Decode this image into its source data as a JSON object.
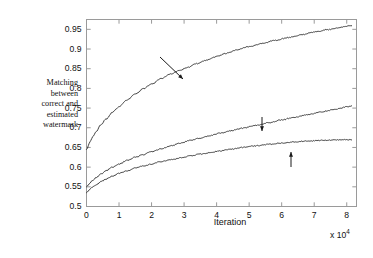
{
  "chart_data": {
    "type": "line",
    "title": "",
    "xlabel": "Iteration",
    "ylabel": "Matching between correct and estimated watermark",
    "x_multiplier": "x 10",
    "x_multiplier_exponent": "4",
    "xlim": [
      0,
      8.3
    ],
    "ylim": [
      0.5,
      0.975
    ],
    "xticks": [
      0,
      1,
      2,
      3,
      4,
      5,
      6,
      7,
      8
    ],
    "xtick_labels": [
      "0",
      "1",
      "2",
      "3",
      "4",
      "5",
      "6",
      "7",
      "8"
    ],
    "yticks": [
      0.5,
      0.55,
      0.6,
      0.65,
      0.7,
      0.75,
      0.8,
      0.85,
      0.9,
      0.95
    ],
    "ytick_labels": [
      "0.5",
      "0.55",
      "0.6",
      "0.65",
      "0.7",
      "0.75",
      "0.8",
      "0.85",
      "0.9",
      "0.95"
    ],
    "grid": false,
    "legend": "none",
    "line_color": "#2b2b2b",
    "frame_color": "#9a9a9a",
    "background": "#ffffff",
    "series": [
      {
        "name": "10 watermarked signals",
        "x": [
          0,
          0.1,
          0.2,
          0.3,
          0.45,
          0.6,
          0.8,
          1.0,
          1.25,
          1.5,
          1.75,
          2.0,
          2.3,
          2.6,
          2.9,
          3.1,
          3.4,
          3.7,
          4.0,
          4.3,
          4.6,
          5.0,
          5.4,
          5.8,
          6.2,
          6.6,
          7.0,
          7.4,
          7.8,
          8.15
        ],
        "values": [
          0.645,
          0.663,
          0.678,
          0.691,
          0.708,
          0.722,
          0.739,
          0.754,
          0.771,
          0.786,
          0.799,
          0.811,
          0.825,
          0.837,
          0.847,
          0.853,
          0.863,
          0.872,
          0.881,
          0.889,
          0.897,
          0.906,
          0.914,
          0.922,
          0.929,
          0.936,
          0.943,
          0.949,
          0.955,
          0.96
        ]
      },
      {
        "name": "2 watermarked signals",
        "x": [
          0,
          0.1,
          0.2,
          0.3,
          0.45,
          0.6,
          0.8,
          1.0,
          1.25,
          1.5,
          1.75,
          2.0,
          2.3,
          2.6,
          2.9,
          3.2,
          3.5,
          3.8,
          4.1,
          4.4,
          4.8,
          5.2,
          5.6,
          6.0,
          6.4,
          6.8,
          7.2,
          7.6,
          8.0,
          8.15
        ],
        "values": [
          0.55,
          0.559,
          0.567,
          0.574,
          0.583,
          0.591,
          0.6,
          0.608,
          0.617,
          0.625,
          0.632,
          0.639,
          0.647,
          0.654,
          0.661,
          0.668,
          0.674,
          0.68,
          0.686,
          0.692,
          0.699,
          0.706,
          0.713,
          0.72,
          0.727,
          0.733,
          0.74,
          0.746,
          0.753,
          0.755
        ]
      },
      {
        "name": "A single watermarked signal",
        "x": [
          0,
          0.1,
          0.2,
          0.3,
          0.45,
          0.6,
          0.8,
          1.0,
          1.25,
          1.5,
          1.75,
          2.0,
          2.3,
          2.6,
          2.9,
          3.2,
          3.5,
          3.8,
          4.1,
          4.4,
          4.8,
          5.2,
          5.6,
          6.0,
          6.4,
          6.8,
          7.2,
          7.6,
          8.0,
          8.15
        ],
        "values": [
          0.535,
          0.543,
          0.55,
          0.556,
          0.563,
          0.57,
          0.577,
          0.584,
          0.591,
          0.598,
          0.603,
          0.608,
          0.614,
          0.619,
          0.624,
          0.629,
          0.633,
          0.637,
          0.641,
          0.645,
          0.65,
          0.654,
          0.658,
          0.661,
          0.664,
          0.666,
          0.668,
          0.669,
          0.67,
          0.67
        ]
      }
    ],
    "annotations": [
      {
        "id": "annot-10",
        "text": "10 watermarked\nsignals",
        "arrow": {
          "x1": 160,
          "y1": 57,
          "x2": 183,
          "y2": 79,
          "style": "diagonal-down-right"
        }
      },
      {
        "id": "annot-2",
        "text": "2 watermarked\nsignals",
        "arrow": {
          "x1": 262,
          "y1": 117,
          "x2": 262,
          "y2": 131,
          "style": "vertical-down"
        }
      },
      {
        "id": "annot-1",
        "text": "A single watermarked\nsignal",
        "arrow": {
          "x1": 291,
          "y1": 167,
          "x2": 291,
          "y2": 152,
          "style": "vertical-up"
        }
      }
    ]
  },
  "page": {
    "caption_fragment": ""
  }
}
